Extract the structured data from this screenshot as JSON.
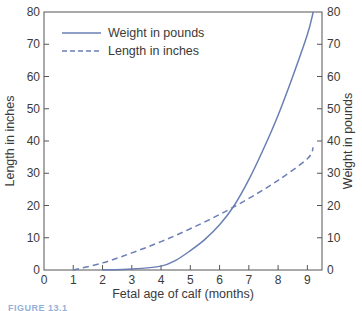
{
  "chart_data": {
    "type": "line",
    "title": "",
    "xlabel": "Fetal age of calf (months)",
    "ylabel_left": "Length in inches",
    "ylabel_right": "Weight in pounds",
    "xlim": [
      0,
      9.5
    ],
    "ylim_left": [
      0,
      80
    ],
    "ylim_right": [
      0,
      80
    ],
    "x_ticks": [
      0,
      1,
      2,
      3,
      4,
      5,
      6,
      7,
      8,
      9
    ],
    "y_ticks_left": [
      0,
      10,
      20,
      30,
      40,
      50,
      60,
      70,
      80
    ],
    "y_ticks_right": [
      0,
      10,
      20,
      30,
      40,
      50,
      60,
      70,
      80
    ],
    "grid": false,
    "legend_position": "upper left",
    "series": [
      {
        "name": "Weight in pounds",
        "style": "solid",
        "axis": "right",
        "color": "#6a7fb5",
        "x": [
          2,
          3,
          4,
          4.5,
          5,
          5.5,
          6,
          6.5,
          7,
          7.5,
          8,
          8.5,
          9,
          9.2
        ],
        "values": [
          0,
          0.3,
          1.2,
          3,
          6,
          9.5,
          14,
          20,
          28,
          37.5,
          48,
          60,
          73,
          80
        ]
      },
      {
        "name": "Length in inches",
        "style": "dashed",
        "axis": "left",
        "color": "#6a7fb5",
        "x": [
          1,
          2,
          3,
          4,
          5,
          6,
          7,
          8,
          9,
          9.2
        ],
        "values": [
          0,
          2.2,
          5.3,
          8.8,
          12.8,
          17.2,
          22.2,
          27.8,
          34.5,
          38
        ]
      }
    ]
  },
  "caption": {
    "text": "FIGURE 13.1"
  }
}
